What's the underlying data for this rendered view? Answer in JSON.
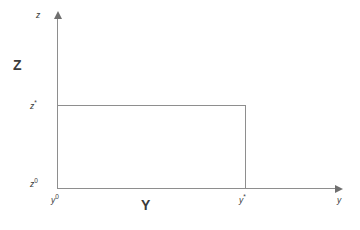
{
  "figure": {
    "type": "diagram",
    "background_color": "#ffffff",
    "line_color": "#8e8e8e",
    "text_color": "#3b3b3b"
  },
  "axes": {
    "vertical": {
      "name": "z",
      "axis_title": "Z",
      "has_arrow": true,
      "tick_labels": [
        {
          "base": "z",
          "sup": "*"
        },
        {
          "base": "z",
          "sup": "0"
        }
      ]
    },
    "horizontal": {
      "name": "y",
      "axis_title": "Y",
      "has_arrow": true,
      "tick_labels": [
        {
          "base": "y",
          "sup": "0"
        },
        {
          "base": "y",
          "sup": "*"
        }
      ]
    }
  },
  "labels": {
    "z_axis_name": "z",
    "y_axis_name": "y",
    "axis_title_z": "Z",
    "axis_title_y": "Y",
    "tick_z_star_base": "z",
    "tick_z_star_sup": "*",
    "tick_z_zero_base": "z",
    "tick_z_zero_sup": "0",
    "tick_y_zero_base": "y",
    "tick_y_zero_sup": "0",
    "tick_y_star_base": "y",
    "tick_y_star_sup": "*"
  },
  "region": {
    "name": "feasible-rectangle",
    "x_from": "y0",
    "x_to": "y*",
    "y_from": "z0",
    "y_to": "z*",
    "fill": "none",
    "stroke": "#8e8e8e"
  }
}
